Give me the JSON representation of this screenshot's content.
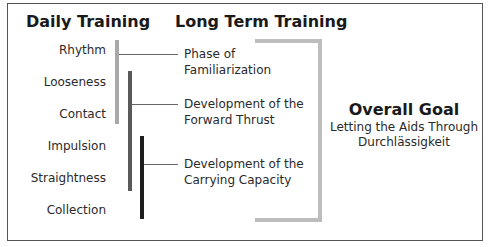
{
  "headings": {
    "daily": "Daily Training",
    "long_term": "Long Term Training"
  },
  "daily_items": [
    "Rhythm",
    "Looseness",
    "Contact",
    "Impulsion",
    "Straightness",
    "Collection"
  ],
  "phases": [
    {
      "line1": "Phase of",
      "line2": "Familiarization",
      "bar_color": "#a8a8a8"
    },
    {
      "line1": "Development of the",
      "line2": "Forward Thrust",
      "bar_color": "#5a5a5a"
    },
    {
      "line1": "Development of the",
      "line2": "Carrying Capacity",
      "bar_color": "#1e1e1e"
    }
  ],
  "goal": {
    "title": "Overall Goal",
    "line1": "Letting the Aids Through",
    "line2": "Durchlässigkeit"
  },
  "colors": {
    "bracket": "#bdbdbd",
    "frame": "#555555"
  }
}
